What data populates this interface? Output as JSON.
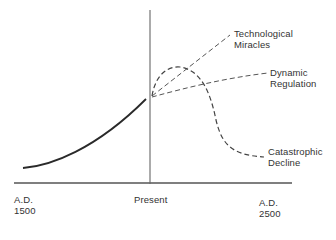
{
  "diagram": {
    "type": "scenario-line-diagram",
    "axis": {
      "start_label_line1": "A.D.",
      "start_label_line2": "1500",
      "middle_label": "Present",
      "end_label_line1": "A.D.",
      "end_label_line2": "2500"
    },
    "historical_curve": {
      "style": "solid",
      "description": "rising curve from A.D. 1500 to Present"
    },
    "scenarios": [
      {
        "id": "technological-miracles",
        "line1": "Technological",
        "line2": "Miracles",
        "style": "dashed"
      },
      {
        "id": "dynamic-regulation",
        "line1": "Dynamic",
        "line2": "Regulation",
        "style": "dashed"
      },
      {
        "id": "catastrophic-decline",
        "line1": "Catastrophic",
        "line2": "Decline",
        "style": "dashed"
      }
    ],
    "colors": {
      "line": "#2a2a2a",
      "dashed": "#555555",
      "axis": "#555555"
    }
  }
}
